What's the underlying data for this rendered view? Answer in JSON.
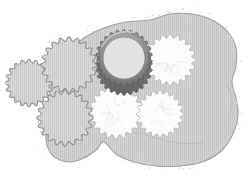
{
  "illustration": {
    "title": "Rolled dough with cut-out cookies and a fluted cookie cutter",
    "canvas": {
      "width": 249,
      "height": 186,
      "background": "#ffffff"
    },
    "palette": {
      "dough_fill": "#d2d2d2",
      "dough_stroke": "#9a9a9a",
      "dough_hatch": "#c2c2c2",
      "cookie_fill": "#d8d8d8",
      "cookie_stroke": "#8f8f8f",
      "cookie_hatch": "#c6c6c6",
      "hole_fill": "#fbfbfb",
      "hole_stroke": "#b9b9b9",
      "cutter_metal_dark": "#6e6e6e",
      "cutter_metal_mid": "#8c8c8c",
      "cutter_metal_light": "#bdbdbd",
      "cutter_interior": "#e2e2e2",
      "flour_speck": "#dcdcdc"
    },
    "dough": {
      "name": "rolled-dough-sheet",
      "outline_points": "150,20 170,14 192,14 212,20 228,32 236,48 236,66 232,82 236,98 238,116 232,136 220,152 202,162 180,166 156,166 134,162 116,154 104,142 96,150 84,158 70,162 56,158 48,148 46,134 50,118 48,102 52,84 58,68 68,52 84,38 104,28 126,22",
      "hatch": {
        "orientation": "vertical",
        "spacing_px": 2,
        "opacity": 0.55
      }
    },
    "cutter": {
      "name": "fluted-round-cookie-cutter",
      "label": "cookie-cutter",
      "center": [
        124,
        58
      ],
      "outer_radius": 27,
      "inner_radius": 21,
      "scallops": 26,
      "rim_depth_px": 9
    },
    "cut_holes": [
      {
        "name": "dough-hole-top-right",
        "center": [
          170,
          60
        ],
        "radius": 24,
        "scallops": 20
      },
      {
        "name": "dough-hole-bottom-left",
        "center": [
          116,
          112
        ],
        "radius": 25,
        "scallops": 20
      },
      {
        "name": "dough-hole-bottom-right",
        "center": [
          160,
          114
        ],
        "radius": 22,
        "scallops": 20
      }
    ],
    "cut_cookies": [
      {
        "name": "cut-cookie-far-left",
        "center": [
          29,
          83
        ],
        "radius": 22,
        "scallops": 20
      },
      {
        "name": "cut-cookie-upper-left",
        "center": [
          69,
          65
        ],
        "radius": 26,
        "scallops": 20
      },
      {
        "name": "cut-cookie-lower-left",
        "center": [
          65,
          118
        ],
        "radius": 26,
        "scallops": 20
      }
    ],
    "flour_dust": {
      "name": "flour-dust-speckles",
      "count": 150,
      "description": "scattered pale speckles along the dough border and around the cut cookies"
    }
  }
}
